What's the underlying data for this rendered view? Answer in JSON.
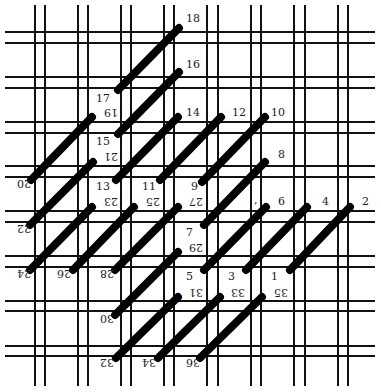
{
  "diagram": {
    "title": "",
    "colors": {
      "background": "#ffffff",
      "grid": "#111111",
      "stitch": "#000000",
      "label": "#222222"
    },
    "grid": {
      "vertical_x": [
        35,
        45,
        78,
        88,
        121,
        131,
        164,
        174,
        207,
        218,
        251,
        261,
        294,
        305,
        338,
        348
      ],
      "horizontal_y": [
        32,
        43,
        77,
        88,
        122,
        133,
        166,
        177,
        211,
        222,
        256,
        267,
        301,
        311,
        346,
        356
      ],
      "x_span": [
        5,
        375
      ],
      "y_span": [
        5,
        386
      ]
    },
    "stitches": [
      {
        "from": "1",
        "to": "2",
        "x1": 290,
        "y1": 270,
        "x2": 350,
        "y2": 207
      },
      {
        "from": "3",
        "to": "4",
        "x1": 246,
        "y1": 270,
        "x2": 307,
        "y2": 207
      },
      {
        "from": "5",
        "to": "6",
        "x1": 204,
        "y1": 270,
        "x2": 266,
        "y2": 207
      },
      {
        "from": "7",
        "to": "8",
        "x1": 204,
        "y1": 225,
        "x2": 265,
        "y2": 162
      },
      {
        "from": "9",
        "to": "10",
        "x1": 202,
        "y1": 182,
        "x2": 265,
        "y2": 117
      },
      {
        "from": "11",
        "to": "12",
        "x1": 160,
        "y1": 180,
        "x2": 221,
        "y2": 117
      },
      {
        "from": "13",
        "to": "14",
        "x1": 116,
        "y1": 180,
        "x2": 178,
        "y2": 117
      },
      {
        "from": "15",
        "to": "16",
        "x1": 118,
        "y1": 134,
        "x2": 179,
        "y2": 72
      },
      {
        "from": "17",
        "to": "18",
        "x1": 118,
        "y1": 90,
        "x2": 179,
        "y2": 28
      },
      {
        "from": "20",
        "to": "19",
        "x1": 31,
        "y1": 180,
        "x2": 92,
        "y2": 117
      },
      {
        "from": "22",
        "to": "21",
        "x1": 30,
        "y1": 225,
        "x2": 93,
        "y2": 162
      },
      {
        "from": "24",
        "to": "23",
        "x1": 30,
        "y1": 270,
        "x2": 92,
        "y2": 207
      },
      {
        "from": "26",
        "to": "25",
        "x1": 73,
        "y1": 270,
        "x2": 134,
        "y2": 207
      },
      {
        "from": "28",
        "to": "27",
        "x1": 115,
        "y1": 270,
        "x2": 178,
        "y2": 207
      },
      {
        "from": "30",
        "to": "29",
        "x1": 115,
        "y1": 315,
        "x2": 178,
        "y2": 252
      },
      {
        "from": "32",
        "to": "31",
        "x1": 116,
        "y1": 358,
        "x2": 178,
        "y2": 297
      },
      {
        "from": "34",
        "to": "33",
        "x1": 158,
        "y1": 358,
        "x2": 220,
        "y2": 297
      },
      {
        "from": "36",
        "to": "35",
        "x1": 200,
        "y1": 358,
        "x2": 262,
        "y2": 297
      }
    ],
    "labels": [
      {
        "text": "1",
        "x": 271,
        "y": 280,
        "inverted": false
      },
      {
        "text": "2",
        "x": 362,
        "y": 205,
        "inverted": false
      },
      {
        "text": "3",
        "x": 228,
        "y": 280,
        "inverted": false
      },
      {
        "text": "4",
        "x": 322,
        "y": 205,
        "inverted": false
      },
      {
        "text": "5",
        "x": 186,
        "y": 280,
        "inverted": false
      },
      {
        "text": "6",
        "x": 278,
        "y": 205,
        "inverted": false
      },
      {
        "text": ",",
        "x": 254,
        "y": 203,
        "inverted": false
      },
      {
        "text": "7",
        "x": 186,
        "y": 236,
        "inverted": false
      },
      {
        "text": "8",
        "x": 278,
        "y": 158,
        "inverted": false
      },
      {
        "text": "9",
        "x": 191,
        "y": 190,
        "inverted": false
      },
      {
        "text": "10",
        "x": 271,
        "y": 116,
        "inverted": false
      },
      {
        "text": "11",
        "x": 142,
        "y": 190,
        "inverted": false
      },
      {
        "text": "12",
        "x": 232,
        "y": 116,
        "inverted": false
      },
      {
        "text": "13",
        "x": 96,
        "y": 190,
        "inverted": false
      },
      {
        "text": "14",
        "x": 186,
        "y": 116,
        "inverted": false
      },
      {
        "text": "15",
        "x": 96,
        "y": 145,
        "inverted": false
      },
      {
        "text": "16",
        "x": 186,
        "y": 68,
        "inverted": false
      },
      {
        "text": "17",
        "x": 96,
        "y": 102,
        "inverted": false
      },
      {
        "text": "18",
        "x": 186,
        "y": 22,
        "inverted": false
      },
      {
        "text": "19",
        "x": 105,
        "y": 113,
        "inverted": true
      },
      {
        "text": "20",
        "x": 18,
        "y": 184,
        "inverted": true
      },
      {
        "text": "21",
        "x": 105,
        "y": 157,
        "inverted": true
      },
      {
        "text": "22",
        "x": 18,
        "y": 229,
        "inverted": true
      },
      {
        "text": "23",
        "x": 105,
        "y": 202,
        "inverted": true
      },
      {
        "text": "24",
        "x": 18,
        "y": 274,
        "inverted": true
      },
      {
        "text": "25",
        "x": 147,
        "y": 202,
        "inverted": true
      },
      {
        "text": "26",
        "x": 58,
        "y": 274,
        "inverted": true
      },
      {
        "text": "27",
        "x": 190,
        "y": 202,
        "inverted": true
      },
      {
        "text": "28",
        "x": 101,
        "y": 274,
        "inverted": true
      },
      {
        "text": "29",
        "x": 190,
        "y": 248,
        "inverted": true
      },
      {
        "text": "30",
        "x": 101,
        "y": 319,
        "inverted": true
      },
      {
        "text": "31",
        "x": 190,
        "y": 293,
        "inverted": true
      },
      {
        "text": "32",
        "x": 101,
        "y": 363,
        "inverted": true
      },
      {
        "text": "33",
        "x": 232,
        "y": 293,
        "inverted": true
      },
      {
        "text": "34",
        "x": 143,
        "y": 363,
        "inverted": true
      },
      {
        "text": "35",
        "x": 275,
        "y": 293,
        "inverted": true
      },
      {
        "text": "36",
        "x": 187,
        "y": 363,
        "inverted": true
      }
    ]
  }
}
